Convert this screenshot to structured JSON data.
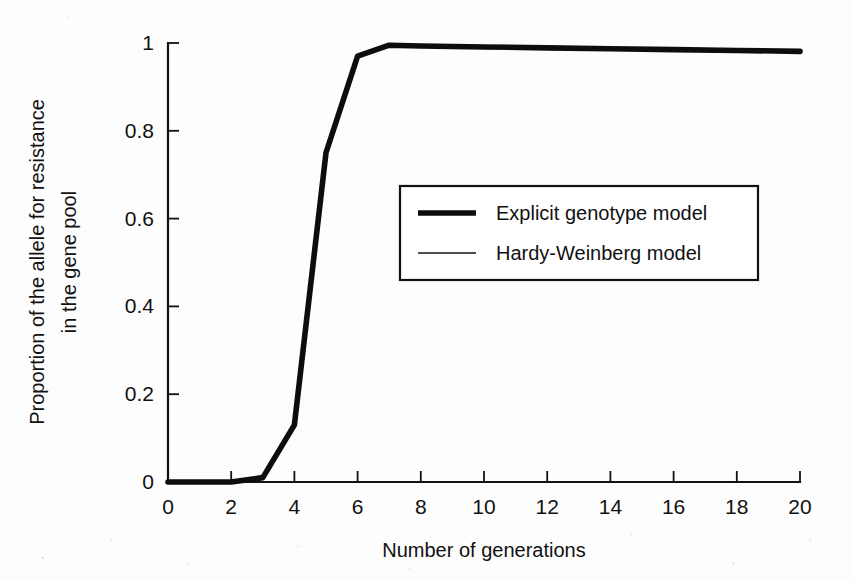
{
  "chart_data": {
    "type": "line",
    "title": "",
    "xlabel": "Number of generations",
    "ylabel": "Proportion of the allele for resistance in the gene pool",
    "ylabel_line1": "Proportion of the allele for resistance",
    "ylabel_line2": "in the gene pool",
    "xlim": [
      0,
      20
    ],
    "ylim": [
      0,
      1
    ],
    "xticks": [
      0,
      2,
      4,
      6,
      8,
      10,
      12,
      14,
      16,
      18,
      20
    ],
    "xtick_labels": [
      "0",
      "2",
      "4",
      "6",
      "8",
      "10",
      "12",
      "14",
      "16",
      "18",
      "20"
    ],
    "yticks": [
      0,
      0.2,
      0.4,
      0.6,
      0.8,
      1
    ],
    "ytick_labels": [
      "0",
      "0.2",
      "0.4",
      "0.6",
      "0.8",
      "1"
    ],
    "grid": false,
    "legend_position": "center-right-inside",
    "x": [
      0,
      1,
      2,
      3,
      4,
      5,
      6,
      7,
      8,
      10,
      12,
      14,
      16,
      18,
      20
    ],
    "series": [
      {
        "name": "Explicit genotype model",
        "style": "thick",
        "values": [
          0.0,
          0.0,
          0.0,
          0.01,
          0.13,
          0.75,
          0.97,
          0.995,
          0.993,
          0.991,
          0.989,
          0.987,
          0.985,
          0.983,
          0.981
        ]
      },
      {
        "name": "Hardy-Weinberg model",
        "style": "thin",
        "values": [
          0.0,
          0.0,
          0.0,
          0.0,
          0.0,
          0.0,
          0.0,
          0.0,
          0.0,
          0.0,
          0.0,
          0.0,
          0.0,
          0.0,
          0.0
        ]
      }
    ],
    "legend": [
      {
        "label": "Explicit genotype model",
        "style": "thick"
      },
      {
        "label": "Hardy-Weinberg model",
        "style": "thin"
      }
    ],
    "colors": {
      "ink": "#111111",
      "background": "#fdfdfd",
      "series_explicit": "#0d0d0d",
      "series_hardy_weinberg": "#151515"
    }
  }
}
